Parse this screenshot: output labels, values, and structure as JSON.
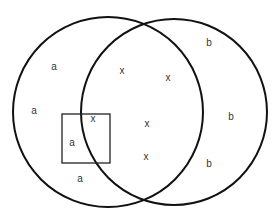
{
  "diagram": {
    "type": "venn",
    "stroke_color": "#111111",
    "circles": [
      {
        "id": "A",
        "cx": 108,
        "cy": 112,
        "r": 95
      },
      {
        "id": "B",
        "cx": 174,
        "cy": 112,
        "r": 93
      }
    ],
    "rectangle": {
      "x": 62,
      "y": 114,
      "width": 48,
      "height": 49
    },
    "labels": [
      {
        "text": "a",
        "x": 54,
        "y": 70,
        "region": "A-only"
      },
      {
        "text": "a",
        "x": 34,
        "y": 114,
        "region": "A-only"
      },
      {
        "text": "a",
        "x": 72,
        "y": 146,
        "region": "A-only, in rectangle"
      },
      {
        "text": "a",
        "x": 80,
        "y": 182,
        "region": "A-only"
      },
      {
        "text": "x",
        "x": 122,
        "y": 74,
        "region": "intersection"
      },
      {
        "text": "x",
        "x": 168,
        "y": 81,
        "region": "intersection"
      },
      {
        "text": "x",
        "x": 93,
        "y": 122,
        "region": "intersection, in rectangle"
      },
      {
        "text": "x",
        "x": 147,
        "y": 127,
        "region": "intersection"
      },
      {
        "text": "x",
        "x": 146,
        "y": 160,
        "region": "intersection"
      },
      {
        "text": "b",
        "x": 209,
        "y": 46,
        "region": "B-only"
      },
      {
        "text": "b",
        "x": 231,
        "y": 120,
        "region": "B-only"
      },
      {
        "text": "b",
        "x": 209,
        "y": 167,
        "region": "B-only"
      }
    ]
  }
}
